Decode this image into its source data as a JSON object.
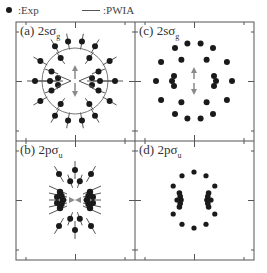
{
  "legend": {
    "exp_label": ":Exp",
    "pwia_label": ":PWIA"
  },
  "panels": [
    {
      "id": "a",
      "label": "(a) 2s",
      "orbital_sym": "σ",
      "orbital_sub": "g"
    },
    {
      "id": "c",
      "label": "(c) 2s",
      "orbital_sym": "σ",
      "orbital_sub": "g"
    },
    {
      "id": "b",
      "label": "(b) 2p",
      "orbital_sym": "σ",
      "orbital_sub": "u"
    },
    {
      "id": "d",
      "label": "(d) 2p",
      "orbital_sym": "σ",
      "orbital_sub": "u"
    }
  ],
  "colors": {
    "dot": "#1a1a1a",
    "line": "#555555",
    "arrow": "#8a8a8a",
    "frame": "#555555"
  }
}
